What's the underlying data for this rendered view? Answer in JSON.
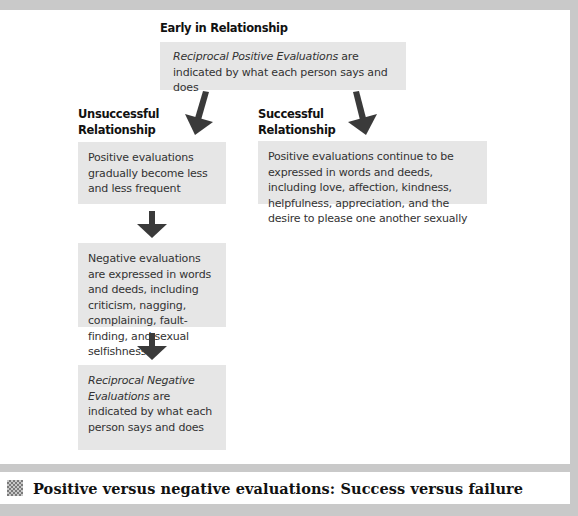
{
  "diagram": {
    "top_heading": "Early in Relationship",
    "top_box": {
      "italic": "Reciprocal Positive Evaluations",
      "rest": " are indicated by what each person says and does"
    },
    "left_branch": {
      "heading_line1": "Unsuccessful",
      "heading_line2": "Relationship",
      "box1": "Positive evaluations gradually become less and less frequent",
      "box2": "Negative evaluations are expressed in words and deeds, including criticism, nagging, complaining, fault-finding, and sexual selfishness",
      "box3": {
        "italic": "Reciprocal Negative Evaluations",
        "rest": " are indicated by what each person says and does"
      }
    },
    "right_branch": {
      "heading_line1": "Successful",
      "heading_line2": "Relationship",
      "box1": "Positive evaluations continue to be expressed in words and deeds, including love, affection, kindness, helpfulness, appreciation, and the desire to please one another sexually"
    },
    "arrow_color": "#3a3a3a",
    "box_color": "#e6e6e6"
  },
  "caption": {
    "icon": "figure-icon",
    "text": "Positive versus negative evaluations: Success versus failure"
  }
}
